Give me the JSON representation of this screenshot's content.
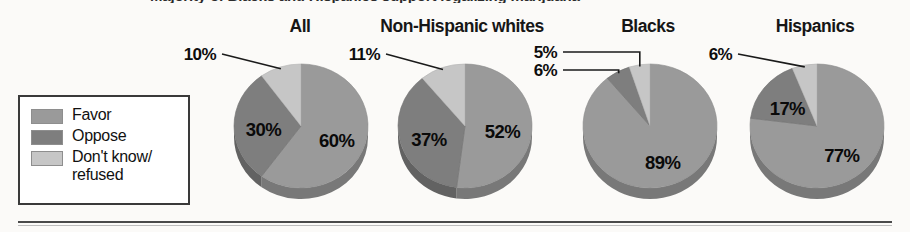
{
  "figure": {
    "clipped_title": "Majority of Blacks and Hispanics support legalizing marijuana",
    "rule_color": "#4a4a4a"
  },
  "legend": {
    "items": [
      {
        "label": "Favor",
        "color": "#9a9a9a",
        "name": "favor"
      },
      {
        "label": "Oppose",
        "color": "#7e7e7e",
        "name": "oppose"
      },
      {
        "label": "Don't know/\nrefused",
        "color": "#c6c6c6",
        "name": "dont-know"
      }
    ]
  },
  "chart_data": {
    "type": "pie",
    "title": "Majority of Blacks and Hispanics support legalizing marijuana",
    "xlabel": "",
    "ylabel": "",
    "legend_position": "left",
    "grid": false,
    "unit": "%",
    "categories": [
      "Favor",
      "Oppose",
      "Don't know/refused"
    ],
    "colors": [
      "#9a9a9a",
      "#7e7e7e",
      "#c6c6c6"
    ],
    "charts": [
      {
        "name": "all",
        "title": "All",
        "values": [
          60,
          30,
          10
        ],
        "labels": [
          "60%",
          "30%",
          "10%"
        ],
        "label_placement": [
          "inside",
          "inside",
          "callout"
        ]
      },
      {
        "name": "non-hispanic-whites",
        "title": "Non-Hispanic whites",
        "values": [
          52,
          37,
          11
        ],
        "labels": [
          "52%",
          "37%",
          "11%"
        ],
        "label_placement": [
          "inside",
          "inside",
          "callout"
        ]
      },
      {
        "name": "blacks",
        "title": "Blacks",
        "values": [
          89,
          6,
          5
        ],
        "labels": [
          "89%",
          "6%",
          "5%"
        ],
        "label_placement": [
          "inside",
          "callout",
          "callout"
        ]
      },
      {
        "name": "hispanics",
        "title": "Hispanics",
        "values": [
          77,
          17,
          6
        ],
        "labels": [
          "77%",
          "17%",
          "6%"
        ],
        "label_placement": [
          "inside",
          "inside",
          "callout"
        ]
      }
    ]
  }
}
